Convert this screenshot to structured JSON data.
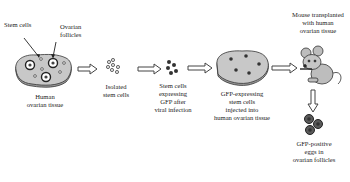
{
  "stages": [
    {
      "id": "tissue",
      "label": "Human\novarian tissue",
      "callouts": [
        "Stem cells",
        "Ovarian\nfollicles"
      ]
    },
    {
      "id": "isolated",
      "label": "Isolated\nstem cells"
    },
    {
      "id": "gfp",
      "label": "Stem cells\nexpressing\nGFP after\nviral infection"
    },
    {
      "id": "injected",
      "label": "GFP-expressing\nstem cells\ninjected into\nhuman ovarian tissue"
    },
    {
      "id": "mouse",
      "label": "Mouse transplanted\nwith human\novarian tissue"
    },
    {
      "id": "eggs",
      "label": "GFP-positive\neggs in\novarian follicles"
    }
  ],
  "colors": {
    "tissue_fill": "#c8c8c8",
    "tissue_shadow": "#9a9a9a",
    "cell_dark": "#333333",
    "egg": "#5a5a5a",
    "arrow_stroke": "#444444"
  }
}
